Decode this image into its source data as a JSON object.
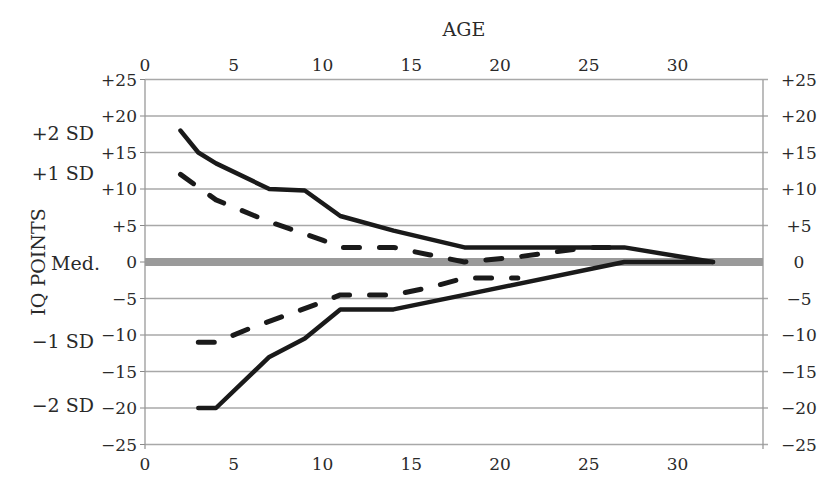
{
  "chart_data": {
    "type": "line",
    "title": "AGE",
    "xlabel": "AGE",
    "ylabel": "IQ POINTS",
    "xlim": [
      0,
      35
    ],
    "ylim": [
      -25,
      25
    ],
    "x_ticks": [
      0,
      5,
      10,
      15,
      20,
      25,
      30
    ],
    "x_tick_labels": [
      "0",
      "5",
      "10",
      "15",
      "20",
      "25",
      "30"
    ],
    "y_ticks": [
      25,
      20,
      15,
      10,
      5,
      0,
      -5,
      -10,
      -15,
      -20,
      -25
    ],
    "y_tick_labels": [
      "+25",
      "+20",
      "+15",
      "+10",
      "+5",
      "0",
      "−5",
      "−10",
      "−15",
      "−20",
      "−25"
    ],
    "grid": true,
    "median_line": {
      "label": "Med.",
      "value": 0,
      "color": "#9a9a9a"
    },
    "sd_labels": [
      {
        "label": "+2 SD",
        "value": 18
      },
      {
        "label": "+1 SD",
        "value": 12
      },
      {
        "label": "Med.",
        "value": 0
      },
      {
        "label": "−1 SD",
        "value": -11
      },
      {
        "label": "−2 SD",
        "value": -20
      }
    ],
    "series": [
      {
        "name": "+2 SD",
        "style": "solid",
        "x": [
          2,
          3,
          4,
          7,
          9,
          11,
          14,
          18,
          27,
          32
        ],
        "y": [
          18,
          15,
          13.5,
          10,
          9.8,
          6.3,
          4.3,
          2,
          2,
          0
        ]
      },
      {
        "name": "+1 SD",
        "style": "dashed",
        "x": [
          2,
          4,
          7,
          10,
          11,
          14,
          16,
          18,
          21,
          25,
          27
        ],
        "y": [
          12,
          8.5,
          5.5,
          3,
          2,
          2,
          1,
          0,
          0.7,
          2,
          2
        ]
      },
      {
        "name": "−1 SD",
        "style": "dashed",
        "x": [
          3,
          4,
          6,
          10,
          11,
          14,
          16,
          18,
          21
        ],
        "y": [
          -11,
          -11,
          -9,
          -5.5,
          -4.5,
          -4.5,
          -3.5,
          -2.2,
          -2.2
        ]
      },
      {
        "name": "−2 SD",
        "style": "solid",
        "x": [
          3,
          4,
          7,
          9,
          11,
          14,
          18,
          27,
          32
        ],
        "y": [
          -20,
          -20,
          -13,
          -10.5,
          -6.5,
          -6.5,
          -4.5,
          0,
          0
        ]
      }
    ],
    "legend": null
  }
}
